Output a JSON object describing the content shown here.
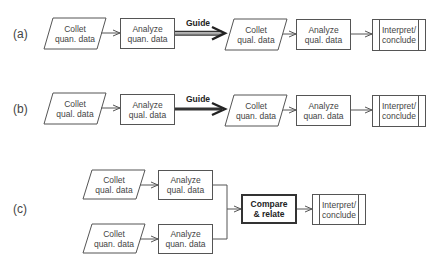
{
  "rows": {
    "a": {
      "label": "(a)",
      "collect": {
        "line1": "Collet",
        "line2": "quan. data"
      },
      "analyze1": {
        "line1": "Analyze",
        "line2": "quan. data"
      },
      "guide": "Guide",
      "collect2": {
        "line1": "Collet",
        "line2": "qual. data"
      },
      "analyze2": {
        "line1": "Analyze",
        "line2": "qual. data"
      },
      "interpret": {
        "line1": "Interpret/",
        "line2": "conclude"
      }
    },
    "b": {
      "label": "(b)",
      "collect": {
        "line1": "Collet",
        "line2": "qual. data"
      },
      "analyze1": {
        "line1": "Analyze",
        "line2": "qual. data"
      },
      "guide": "Guide",
      "collect2": {
        "line1": "Collet",
        "line2": "quan. data"
      },
      "analyze2": {
        "line1": "Analyze",
        "line2": "quan. data"
      },
      "interpret": {
        "line1": "Interpret/",
        "line2": "conclude"
      }
    },
    "c": {
      "label": "(c)",
      "collect_top": {
        "line1": "Collet",
        "line2": "qual. data"
      },
      "analyze_top": {
        "line1": "Analyze",
        "line2": "qual. data"
      },
      "collect_bottom": {
        "line1": "Collet",
        "line2": "quan. data"
      },
      "analyze_bottom": {
        "line1": "Analyze",
        "line2": "quan. data"
      },
      "compare": {
        "line1": "Compare",
        "line2": "& relate"
      },
      "interpret": {
        "line1": "Interpret/",
        "line2": "conclude"
      }
    }
  },
  "colors": {
    "stroke": "#555555",
    "guide_solid": "#333333",
    "guide_hollow_fill": "#9a9a9a"
  }
}
